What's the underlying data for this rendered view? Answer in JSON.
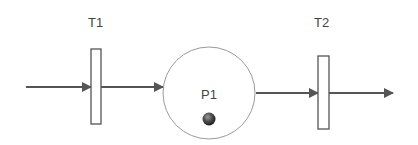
{
  "diagram": {
    "type": "petri-net",
    "transitions": [
      {
        "id": "T1",
        "label": "T1"
      },
      {
        "id": "T2",
        "label": "T2"
      }
    ],
    "places": [
      {
        "id": "P1",
        "label": "P1",
        "tokens": 1
      }
    ],
    "arcs": [
      {
        "from": "input",
        "to": "T1"
      },
      {
        "from": "T1",
        "to": "P1"
      },
      {
        "from": "P1",
        "to": "T2"
      },
      {
        "from": "T2",
        "to": "output"
      }
    ],
    "colors": {
      "arc": "#555555",
      "transition_stroke": "#555555",
      "place_stroke": "#9a9a9a",
      "token": "#3a3a3a",
      "label": "#444444"
    }
  }
}
